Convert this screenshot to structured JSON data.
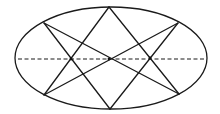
{
  "diagram": {
    "ellipse": {
      "cx": 111,
      "cy": 58,
      "rx": 96,
      "ry": 51
    },
    "points": {
      "top": [
        109,
        7
      ],
      "bottom": [
        110,
        109
      ],
      "upper_left": [
        44,
        23
      ],
      "upper_right": [
        178,
        23
      ],
      "lower_left": [
        44,
        95
      ],
      "lower_right": [
        179,
        94
      ],
      "center": [
        109,
        59
      ],
      "left_crossing": [
        71,
        59
      ],
      "right_crossing": [
        150,
        58
      ]
    },
    "segments": [
      [
        "top",
        "lower_left"
      ],
      [
        "top",
        "lower_right"
      ],
      [
        "bottom",
        "upper_left"
      ],
      [
        "bottom",
        "upper_right"
      ],
      [
        "upper_left",
        "lower_right"
      ],
      [
        "upper_right",
        "lower_left"
      ]
    ],
    "axis": {
      "x1": 18,
      "x2": 206,
      "y": 59,
      "style": "dashed"
    },
    "colors": {
      "line": "#1a1a1a",
      "background": "#ffffff"
    }
  }
}
